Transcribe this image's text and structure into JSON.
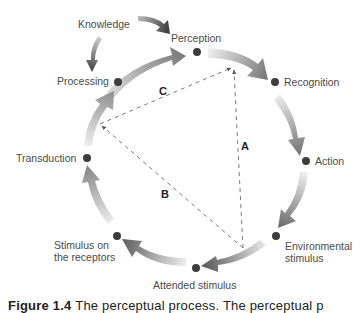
{
  "diagram": {
    "type": "perceptual-process-cycle",
    "nodes": [
      {
        "id": "perception",
        "label": "Perception"
      },
      {
        "id": "recognition",
        "label": "Recognition"
      },
      {
        "id": "action",
        "label": "Action"
      },
      {
        "id": "environmental-stimulus",
        "label_line1": "Environmental",
        "label_line2": "stimulus"
      },
      {
        "id": "attended-stimulus",
        "label": "Attended stimulus"
      },
      {
        "id": "stimulus-on-receptors",
        "label_line1": "Stimulus on",
        "label_line2": "the receptors"
      },
      {
        "id": "transduction",
        "label": "Transduction"
      },
      {
        "id": "processing",
        "label": "Processing"
      }
    ],
    "knowledge": {
      "label": "Knowledge",
      "feeds_into": [
        "Perception",
        "Processing"
      ]
    },
    "relationships": [
      {
        "letter": "A",
        "from": "Environmental stimulus",
        "to": "Perception"
      },
      {
        "letter": "B",
        "from": "Environmental stimulus",
        "to": "Transduction/Processing side"
      },
      {
        "letter": "C",
        "from": "Processing side",
        "to": "Perception"
      }
    ],
    "colors": {
      "arrow_dark": "#6e6e6e",
      "arrow_light": "#f2f2f2",
      "node_dot": "#3d3d3d",
      "knowledge_arrow": "#4a4a4a",
      "dashed_line": "#7a7a7a",
      "text": "#4a4a4a"
    }
  },
  "caption": {
    "figure_label": "Figure 1.4",
    "text": "The perceptual process. The perceptual p"
  }
}
